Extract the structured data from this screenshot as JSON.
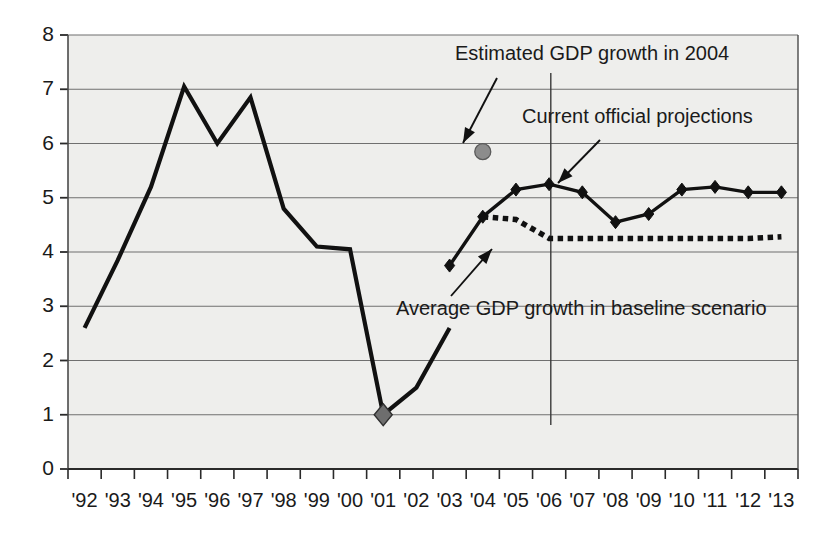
{
  "chart_data": {
    "type": "line",
    "title": "",
    "subtitle": "",
    "xlabel": "",
    "ylabel": "",
    "xlim": [
      "'92",
      "'13"
    ],
    "ylim": [
      0,
      8
    ],
    "y_ticks": [
      0,
      1,
      2,
      3,
      4,
      5,
      6,
      7,
      8
    ],
    "grid": "horizontal",
    "legend_position": "none",
    "categories": [
      "'92",
      "'93",
      "'94",
      "'95",
      "'96",
      "'97",
      "'98",
      "'99",
      "'00",
      "'01",
      "'02",
      "'03",
      "'04",
      "'05",
      "'06",
      "'07",
      "'08",
      "'09",
      "'10",
      "'11",
      "'12",
      "'13"
    ],
    "series": [
      {
        "name": "Historical GDP growth",
        "style": "solid-thick",
        "color": "#111111",
        "markers": "none",
        "x": [
          "'92",
          "'93",
          "'94",
          "'95",
          "'96",
          "'97",
          "'98",
          "'99",
          "'00",
          "'01",
          "'02",
          "'03"
        ],
        "values": [
          2.6,
          3.85,
          5.2,
          7.05,
          6.0,
          6.85,
          4.8,
          4.1,
          4.05,
          1.0,
          1.5,
          2.6
        ]
      },
      {
        "name": "Current official projections",
        "style": "solid-thick",
        "color": "#111111",
        "markers": "diamond",
        "x": [
          "'03",
          "'04",
          "'05",
          "'06",
          "'07",
          "'08",
          "'09",
          "'10",
          "'11",
          "'12",
          "'13"
        ],
        "values": [
          3.75,
          4.65,
          5.15,
          5.25,
          5.1,
          4.55,
          4.7,
          5.15,
          5.2,
          5.1,
          5.1
        ]
      },
      {
        "name": "Average GDP growth in baseline scenario",
        "style": "dotted-thick",
        "color": "#111111",
        "markers": "none",
        "x": [
          "'04",
          "'05",
          "'06",
          "'07",
          "'08",
          "'09",
          "'10",
          "'11",
          "'12",
          "'13"
        ],
        "values": [
          4.65,
          4.6,
          4.25,
          4.25,
          4.25,
          4.25,
          4.25,
          4.25,
          4.25,
          4.28
        ]
      }
    ],
    "points": [
      {
        "name": "Estimated GDP growth in 2004",
        "x": "'04",
        "value": 5.85,
        "marker": "circle",
        "color": "#8c8c8c"
      },
      {
        "name": "Recession trough marker",
        "x": "'01",
        "value": 1.0,
        "marker": "diamond",
        "color": "#6e6e6e"
      }
    ],
    "annotations": [
      {
        "id": "estimated-2004",
        "text": "Estimated GDP growth in 2004",
        "points_to": "'04 estimate circle at 5.85"
      },
      {
        "id": "current-projections",
        "text": "Current official projections",
        "points_to": "projection line near '06"
      },
      {
        "id": "baseline-average",
        "text": "Average GDP growth in baseline scenario",
        "points_to": "dotted baseline line near '06 at 4.25"
      }
    ],
    "vertical_divider": {
      "at": "'06",
      "label": ""
    }
  },
  "axis": {
    "y_tick_labels": [
      "8",
      "7",
      "6",
      "5",
      "4",
      "3",
      "2",
      "1",
      "0"
    ],
    "x_tick_labels": [
      "'92",
      "'93",
      "'94",
      "'95",
      "'96",
      "'97",
      "'98",
      "'99",
      "'00",
      "'01",
      "'02",
      "'03",
      "'04",
      "'05",
      "'06",
      "'07",
      "'08",
      "'09",
      "'10",
      "'11",
      "'12",
      "'13"
    ]
  },
  "colors": {
    "ink": "#111111",
    "grid": "#6f6f6f",
    "plot_bg": "#eeeeec",
    "estimate_marker": "#8c8c8c",
    "trough_marker": "#6e6e6e"
  }
}
